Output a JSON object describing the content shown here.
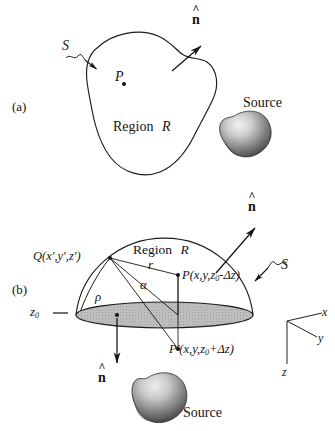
{
  "figure": {
    "panels": [
      {
        "tag": "(a)",
        "region_label": "Region",
        "region_symbol": "R",
        "surface_label": "S",
        "point_label": "P",
        "normal_label": "n",
        "source_label": "Source"
      },
      {
        "tag": "(b)",
        "region_label": "Region",
        "region_symbol": "R",
        "surface_label": "S",
        "source_point": "Q(x',y',z')",
        "field_point": "P(x,y,z",
        "field_point_sub": "0",
        "field_point_tail": "-Δz)",
        "image_point": "P'(x,y,z",
        "image_point_sub": "0",
        "image_point_tail": "+Δz)",
        "plane_label": "z",
        "plane_label_sub": "0",
        "dist_r": "r",
        "dist_rho": "ρ",
        "angle_alpha": "α",
        "normal_label": "n",
        "source_label": "Source",
        "axes": {
          "x": "x",
          "y": "y",
          "z": "z"
        }
      }
    ]
  },
  "colors": {
    "ink": "#141414",
    "stroke": "#1c1c1c",
    "disk_fill": "#bdbdbd",
    "blob_dark": "#3a3a3a",
    "blob_light": "#e8e8e8",
    "paper": "#ffffff"
  }
}
